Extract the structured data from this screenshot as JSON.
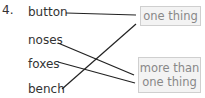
{
  "question": {
    "number": "4.",
    "words": [
      {
        "label": "button"
      },
      {
        "label": "noses"
      },
      {
        "label": "foxes"
      },
      {
        "label": "bench"
      }
    ],
    "targets": [
      {
        "label": "one thing"
      },
      {
        "label_line1": "more than",
        "label_line2": "one thing"
      }
    ],
    "connections": [
      {
        "from": "button",
        "to": "one thing"
      },
      {
        "from": "noses",
        "to": "more than one thing"
      },
      {
        "from": "foxes",
        "to": "more than one thing"
      },
      {
        "from": "bench",
        "to": "one thing"
      }
    ],
    "colors": {
      "text": "#333333",
      "box_border": "#cfcfcf",
      "box_fill": "#f3f3f3",
      "box_text": "#888888",
      "line": "#222222"
    }
  }
}
